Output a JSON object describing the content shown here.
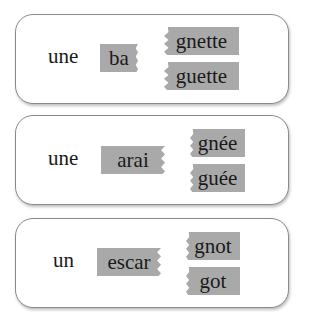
{
  "exercises": [
    {
      "article": "une",
      "stem": "ba",
      "options": [
        "gnette",
        "guette"
      ],
      "linked": "guette"
    },
    {
      "article": "une",
      "stem": "arai",
      "options": [
        "gnée",
        "guée"
      ],
      "linked": "gnée"
    },
    {
      "article": "un",
      "stem": "escar",
      "options": [
        "gnot",
        "got"
      ],
      "linked": "got"
    }
  ],
  "colors": {
    "tile": "#a9a9a9",
    "border": "#8a8a8a",
    "line": "#9a9a9a"
  }
}
